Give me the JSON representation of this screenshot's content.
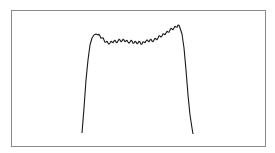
{
  "chart_data": {
    "type": "line",
    "title": "",
    "xlabel": "",
    "ylabel": "",
    "grid": false,
    "legend": null,
    "frame": {
      "left": 11,
      "top": 10,
      "right": 265,
      "bottom": 146,
      "color": "#8a8a8a"
    },
    "line_color": "#1a1a1a",
    "x": [
      0,
      2,
      4,
      5,
      6,
      8,
      10,
      15,
      20,
      25,
      30,
      35,
      40,
      45,
      50,
      55,
      60,
      65,
      70,
      75,
      80,
      85,
      88,
      90,
      92,
      94,
      96,
      98,
      100
    ],
    "values": [
      0.05,
      0.6,
      0.88,
      0.93,
      0.94,
      0.92,
      0.87,
      0.84,
      0.85,
      0.86,
      0.86,
      0.85,
      0.85,
      0.84,
      0.85,
      0.86,
      0.86,
      0.87,
      0.88,
      0.91,
      0.93,
      0.96,
      0.99,
      1.0,
      0.95,
      0.7,
      0.4,
      0.15,
      0.05
    ],
    "pixel_points": [
      [
        82,
        133
      ],
      [
        84,
        108
      ],
      [
        86,
        80
      ],
      [
        88,
        60
      ],
      [
        90,
        45
      ],
      [
        92,
        38
      ],
      [
        94,
        35
      ],
      [
        96,
        34
      ],
      [
        98,
        35
      ],
      [
        100,
        36
      ],
      [
        102,
        38
      ],
      [
        104,
        40
      ],
      [
        106,
        42
      ],
      [
        108,
        43
      ],
      [
        110,
        43
      ],
      [
        112,
        42
      ],
      [
        114,
        41
      ],
      [
        116,
        42
      ],
      [
        118,
        41
      ],
      [
        120,
        40
      ],
      [
        122,
        41
      ],
      [
        124,
        40
      ],
      [
        126,
        41
      ],
      [
        128,
        42
      ],
      [
        130,
        42
      ],
      [
        132,
        41
      ],
      [
        134,
        43
      ],
      [
        136,
        42
      ],
      [
        138,
        43
      ],
      [
        140,
        42
      ],
      [
        142,
        44
      ],
      [
        144,
        42
      ],
      [
        146,
        41
      ],
      [
        148,
        41
      ],
      [
        150,
        40
      ],
      [
        152,
        41
      ],
      [
        154,
        40
      ],
      [
        156,
        39
      ],
      [
        158,
        38
      ],
      [
        160,
        36
      ],
      [
        162,
        36
      ],
      [
        164,
        34
      ],
      [
        166,
        33
      ],
      [
        168,
        32
      ],
      [
        170,
        30
      ],
      [
        172,
        29
      ],
      [
        174,
        28
      ],
      [
        176,
        27
      ],
      [
        178,
        25
      ],
      [
        180,
        28
      ],
      [
        182,
        34
      ],
      [
        184,
        48
      ],
      [
        186,
        70
      ],
      [
        188,
        95
      ],
      [
        190,
        115
      ],
      [
        192,
        128
      ],
      [
        193,
        134
      ]
    ]
  }
}
